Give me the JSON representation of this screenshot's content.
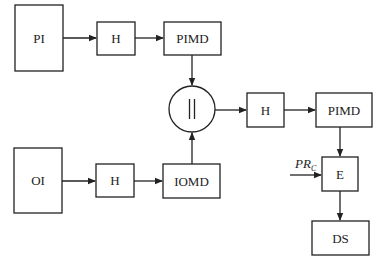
{
  "diagram": {
    "nodes": {
      "pi": {
        "label": "PI"
      },
      "h_top": {
        "label": "H"
      },
      "pimd_top": {
        "label": "PIMD"
      },
      "concat": {
        "label": "||"
      },
      "h_mid": {
        "label": "H"
      },
      "pimd_right": {
        "label": "PIMD"
      },
      "oi": {
        "label": "OI"
      },
      "h_bottom": {
        "label": "H"
      },
      "iomd": {
        "label": "IOMD"
      },
      "e": {
        "label": "E"
      },
      "ds": {
        "label": "DS"
      }
    },
    "input": {
      "label_main": "PR",
      "label_sub": "C"
    },
    "edges": [
      {
        "from": "pi",
        "to": "h_top"
      },
      {
        "from": "h_top",
        "to": "pimd_top"
      },
      {
        "from": "pimd_top",
        "to": "concat"
      },
      {
        "from": "oi",
        "to": "h_bottom"
      },
      {
        "from": "h_bottom",
        "to": "iomd"
      },
      {
        "from": "iomd",
        "to": "concat"
      },
      {
        "from": "concat",
        "to": "h_mid"
      },
      {
        "from": "h_mid",
        "to": "pimd_right"
      },
      {
        "from": "pimd_right",
        "to": "e"
      },
      {
        "from": "PR_C",
        "to": "e"
      },
      {
        "from": "e",
        "to": "ds"
      }
    ]
  }
}
